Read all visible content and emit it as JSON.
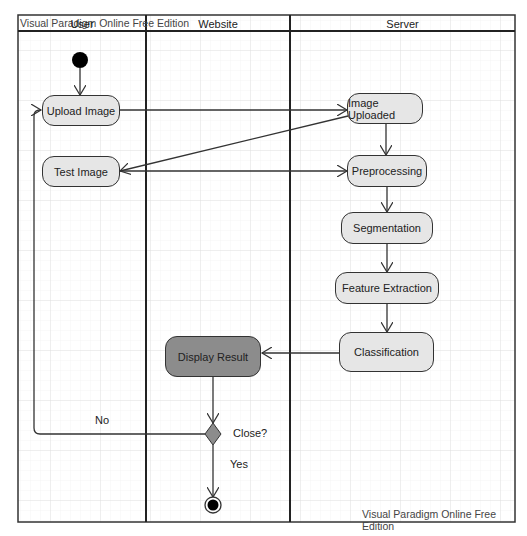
{
  "watermark": {
    "top": "Visual Paradigm Online Free Edition",
    "bottom": "Visual Paradigm Online Free Edition"
  },
  "swimlanes": [
    {
      "title": "User"
    },
    {
      "title": "Website"
    },
    {
      "title": "Server"
    }
  ],
  "nodes": {
    "upload_image": "Upload Image",
    "test_image": "Test Image",
    "image_uploaded": "Image Uploaded",
    "preprocessing": "Preprocessing",
    "segmentation": "Segmentation",
    "feature_extraction": "Feature Extraction",
    "classification": "Classification",
    "display_result": "Display Result"
  },
  "decision": {
    "label": "Close?",
    "no_label": "No",
    "yes_label": "Yes"
  },
  "colors": {
    "node_fill": "#e6e6e6",
    "highlight_fill": "#8c8c8c",
    "decision_fill": "#8c8c8c",
    "line": "#333333",
    "grid": "#e4e4e4"
  }
}
